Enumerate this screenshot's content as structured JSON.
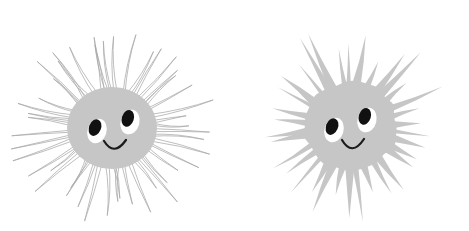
{
  "canvas": {
    "width": 469,
    "height": 231,
    "background_color": "#ffffff",
    "title": "Two spiky smiling sun characters"
  },
  "palette": {
    "body_gray": "#c6c6c6",
    "spike_fill_gray": "#c6c6c6",
    "spike_outline_gray": "#a8a8a8",
    "eye_white": "#ffffff",
    "pupil_black": "#111111",
    "mouth_black": "#1a1a1a",
    "background": "#ffffff"
  },
  "figures": [
    {
      "id": "left-character",
      "name": "hairy-spike-character",
      "label": "Left character with thin outlined hair-like spikes",
      "spike_style": "outline",
      "spike_count": 46,
      "body": {
        "center_x": 112,
        "center_y": 128,
        "radius_x": 45,
        "radius_y": 41,
        "fill": "#c6c6c6"
      },
      "spikes": {
        "inner_radius_x": 40,
        "inner_radius_y": 36,
        "min_length": 34,
        "max_length": 66,
        "base_half_width_deg": 2.1,
        "curve_amount": 7,
        "stroke_width": 0.75,
        "stroke": "#a8a8a8",
        "fill": "none"
      },
      "face": {
        "left_eye": {
          "center_x": 97,
          "center_y": 131,
          "radius_x": 9.5,
          "radius_y": 12.5,
          "rotation": 18,
          "white": "#ffffff",
          "pupil": {
            "offset_x": -2.0,
            "offset_y": -3.4,
            "radius_x": 6.0,
            "radius_y": 8.6,
            "rotation": 22,
            "fill": "#111111"
          }
        },
        "right_eye": {
          "center_x": 130,
          "center_y": 122,
          "radius_x": 9.5,
          "radius_y": 12.5,
          "rotation": 14,
          "white": "#ffffff",
          "pupil": {
            "offset_x": -2.2,
            "offset_y": -3.6,
            "radius_x": 6.0,
            "radius_y": 8.6,
            "rotation": 18,
            "fill": "#111111"
          }
        },
        "mouth": {
          "path": "M 104 141 Q 114 157 126 140",
          "stroke": "#1a1a1a",
          "stroke_width": 2.2
        }
      }
    },
    {
      "id": "right-character",
      "name": "solid-spike-character",
      "label": "Right character with solid filled triangular spikes",
      "spike_style": "solid",
      "spike_count": 34,
      "body": {
        "center_x": 350,
        "center_y": 126,
        "radius_x": 47,
        "radius_y": 44,
        "fill": "#c6c6c6",
        "wobble": 4
      },
      "spikes": {
        "inner_radius_x": 42,
        "inner_radius_y": 39,
        "min_length": 26,
        "max_length": 62,
        "base_half_width_deg": 4.6,
        "curve_amount": 3,
        "stroke_width": 0,
        "stroke": "none",
        "fill": "#c6c6c6"
      },
      "face": {
        "left_eye": {
          "center_x": 334,
          "center_y": 130,
          "radius_x": 9.5,
          "radius_y": 12.5,
          "rotation": 18,
          "white": "#ffffff",
          "pupil": {
            "offset_x": -2.0,
            "offset_y": -3.4,
            "radius_x": 6.0,
            "radius_y": 8.6,
            "rotation": 22,
            "fill": "#111111"
          }
        },
        "right_eye": {
          "center_x": 367,
          "center_y": 120,
          "radius_x": 9.5,
          "radius_y": 12.5,
          "rotation": 14,
          "white": "#ffffff",
          "pupil": {
            "offset_x": -2.2,
            "offset_y": -3.6,
            "radius_x": 6.0,
            "radius_y": 8.6,
            "rotation": 18,
            "fill": "#111111"
          }
        },
        "mouth": {
          "path": "M 342 140 Q 352 157 364 139",
          "stroke": "#1a1a1a",
          "stroke_width": 2.2
        }
      }
    }
  ]
}
